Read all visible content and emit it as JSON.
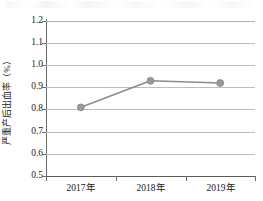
{
  "chart_data": {
    "type": "line",
    "title": "",
    "subtitle": "",
    "xlabel": "",
    "ylabel": "严重产后出血率（%）",
    "categories": [
      "2017年",
      "2018年",
      "2019年"
    ],
    "values": [
      0.81,
      0.93,
      0.92
    ],
    "series": [
      {
        "name": "严重产后出血率",
        "values": [
          0.81,
          0.93,
          0.92
        ]
      }
    ],
    "ylim": [
      0.5,
      1.2
    ],
    "ytick_step": 0.1,
    "yticks": [
      "1.2",
      "1.1",
      "1.0",
      "0.9",
      "0.8",
      "0.7",
      "0.6",
      "0.5"
    ],
    "ytick_values": [
      1.2,
      1.1,
      1.0,
      0.9,
      0.8,
      0.7,
      0.6,
      0.5
    ],
    "grid": true,
    "grid_axis": "y",
    "legend": false,
    "legend_position": "none",
    "annotations": [],
    "marker": "circle"
  },
  "style": {
    "series_color": "#8c8c8c",
    "marker_color": "#9a9a9a",
    "marker_edge_color": "#8c8c8c",
    "grid_color": "#bdbdbd",
    "axis_color": "#6b6b6b",
    "baseline_color": "#5c5c5c",
    "text_color": "#1a1a1a",
    "background": "#ffffff"
  }
}
